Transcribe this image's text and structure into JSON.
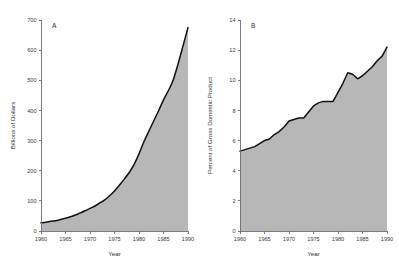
{
  "figure": {
    "width": 399,
    "height": 277,
    "background": "#ffffff",
    "fill_color": "#b7b7b7",
    "line_color": "#111111",
    "axis_color": "#6f6f6f"
  },
  "chart_data": [
    {
      "id": "panel-a",
      "type": "area",
      "title": "",
      "panel_label": "A",
      "xlabel": "Year",
      "ylabel": "Billions of Dollars",
      "xlim": [
        1960,
        1990
      ],
      "ylim": [
        0,
        700
      ],
      "xticks": [
        1960,
        1965,
        1970,
        1975,
        1980,
        1985,
        1990
      ],
      "xticklabels": [
        "1960",
        "1965",
        "1970",
        "1975",
        "1980",
        "1985",
        "1990"
      ],
      "yticks": [
        0,
        100,
        200,
        300,
        400,
        500,
        600,
        700
      ],
      "yticklabels": [
        "0",
        "100",
        "200",
        "300",
        "400",
        "500",
        "600",
        "700"
      ],
      "grid": false,
      "legend": "none",
      "fill_color": "#b7b7b7",
      "line_color": "#111111",
      "x": [
        1960,
        1961,
        1962,
        1963,
        1964,
        1965,
        1966,
        1967,
        1968,
        1969,
        1970,
        1971,
        1972,
        1973,
        1974,
        1975,
        1976,
        1977,
        1978,
        1979,
        1980,
        1981,
        1982,
        1983,
        1984,
        1985,
        1986,
        1987,
        1988,
        1989,
        1990
      ],
      "values": [
        27,
        29,
        32,
        34,
        38,
        42,
        47,
        53,
        60,
        67,
        75,
        83,
        93,
        103,
        117,
        133,
        152,
        172,
        194,
        221,
        256,
        296,
        331,
        365,
        399,
        435,
        466,
        502,
        556,
        615,
        675
      ],
      "series": [
        {
          "name": "National Health Expenditures",
          "values": [
            27,
            29,
            32,
            34,
            38,
            42,
            47,
            53,
            60,
            67,
            75,
            83,
            93,
            103,
            117,
            133,
            152,
            172,
            194,
            221,
            256,
            296,
            331,
            365,
            399,
            435,
            466,
            502,
            556,
            615,
            675
          ]
        }
      ]
    },
    {
      "id": "panel-b",
      "type": "area",
      "title": "",
      "panel_label": "B",
      "xlabel": "Year",
      "ylabel": "Percent of Gross Domestic Product",
      "xlim": [
        1960,
        1990
      ],
      "ylim": [
        0,
        14
      ],
      "xticks": [
        1960,
        1965,
        1970,
        1975,
        1980,
        1985,
        1990
      ],
      "xticklabels": [
        "1960",
        "1965",
        "1970",
        "1975",
        "1980",
        "1985",
        "1990"
      ],
      "yticks": [
        0,
        2,
        4,
        6,
        8,
        10,
        12,
        14
      ],
      "yticklabels": [
        "0",
        "2",
        "4",
        "6",
        "8",
        "10",
        "12",
        "14"
      ],
      "grid": false,
      "legend": "none",
      "fill_color": "#b7b7b7",
      "line_color": "#111111",
      "x": [
        1960,
        1961,
        1962,
        1963,
        1964,
        1965,
        1966,
        1967,
        1968,
        1969,
        1970,
        1971,
        1972,
        1973,
        1974,
        1975,
        1976,
        1977,
        1978,
        1979,
        1980,
        1981,
        1982,
        1983,
        1984,
        1985,
        1986,
        1987,
        1988,
        1989,
        1990
      ],
      "values": [
        5.3,
        5.4,
        5.5,
        5.6,
        5.8,
        6.0,
        6.1,
        6.4,
        6.6,
        6.9,
        7.3,
        7.4,
        7.5,
        7.5,
        7.9,
        8.3,
        8.5,
        8.6,
        8.6,
        8.6,
        9.2,
        9.8,
        10.5,
        10.4,
        10.1,
        10.3,
        10.6,
        10.9,
        11.3,
        11.6,
        12.2
      ],
      "series": [
        {
          "name": "Health Expenditures as Percent of GDP",
          "values": [
            5.3,
            5.4,
            5.5,
            5.6,
            5.8,
            6.0,
            6.1,
            6.4,
            6.6,
            6.9,
            7.3,
            7.4,
            7.5,
            7.5,
            7.9,
            8.3,
            8.5,
            8.6,
            8.6,
            8.6,
            9.2,
            9.8,
            10.5,
            10.4,
            10.1,
            10.3,
            10.6,
            10.9,
            11.3,
            11.6,
            12.2
          ]
        }
      ]
    }
  ]
}
